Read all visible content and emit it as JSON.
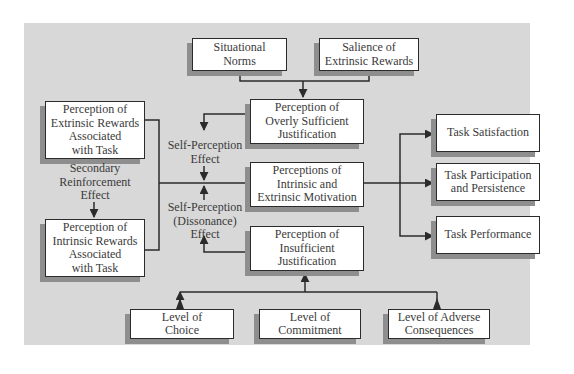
{
  "diagram": {
    "colors": {
      "panel": "#d8d8d8",
      "box_fill": "#ffffff",
      "border": "#2b2b2b",
      "shadow": "#8e8e8e",
      "text": "#3a3a3a"
    },
    "top_inputs": [
      {
        "id": "situational-norms",
        "text": "Situational\nNorms"
      },
      {
        "id": "salience-of-extrinsic-rewards",
        "text": "Salience of\nExtrinsic Rewards"
      }
    ],
    "center": {
      "overly_sufficient": "Perception of\nOverly Sufficient\nJustification",
      "motivation": "Perceptions of\nIntrinsic and\nExtrinsic Motivation",
      "insufficient": "Perception of\nInsufficient\nJustification"
    },
    "left": {
      "extrinsic_rewards": "Perception of\nExtrinsic Rewards\nAssociated\nwith Task",
      "intrinsic_rewards": "Perception of\nIntrinsic Rewards\nAssociated\nwith Task",
      "secondary_reinforcement": "Secondary\nReinforcement\nEffect"
    },
    "effects": {
      "self_perception": "Self-Perception\nEffect",
      "self_perception_dissonance": "Self-Perception\n(Dissonance)\nEffect"
    },
    "outcomes": [
      {
        "id": "task-satisfaction",
        "text": "Task Satisfaction"
      },
      {
        "id": "task-participation",
        "text": "Task Participation\nand Persistence"
      },
      {
        "id": "task-performance",
        "text": "Task Performance"
      }
    ],
    "bottom_inputs": [
      {
        "id": "level-of-choice",
        "text": "Level of\nChoice"
      },
      {
        "id": "level-of-commitment",
        "text": "Level of\nCommitment"
      },
      {
        "id": "level-of-adverse-consequences",
        "text": "Level of Adverse\nConsequences"
      }
    ]
  }
}
